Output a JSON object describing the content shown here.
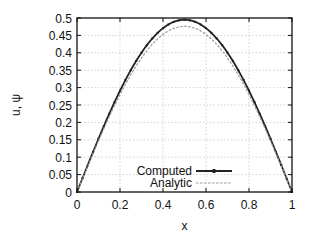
{
  "chart_data": {
    "type": "line",
    "title": "",
    "xlabel": "x",
    "ylabel": "u, ψ",
    "xlim": [
      0,
      1
    ],
    "ylim": [
      0,
      0.5
    ],
    "grid": true,
    "legend_position": "lower center (inside plot)",
    "x_ticks": [
      "0",
      "0.2",
      "0.4",
      "0.6",
      "0.8",
      "1"
    ],
    "y_ticks": [
      "0",
      "0.05",
      "0.1",
      "0.15",
      "0.2",
      "0.25",
      "0.3",
      "0.35",
      "0.4",
      "0.45",
      "0.5"
    ],
    "series": [
      {
        "name": "Computed",
        "style": "solid with point markers",
        "color": "#222222",
        "x": [
          0,
          0.1,
          0.2,
          0.3,
          0.4,
          0.5,
          0.6,
          0.7,
          0.8,
          0.9,
          1
        ],
        "values": [
          0,
          0.178,
          0.317,
          0.416,
          0.475,
          0.495,
          0.475,
          0.416,
          0.317,
          0.178,
          0
        ]
      },
      {
        "name": "Analytic",
        "style": "dashed",
        "color": "#999999",
        "x": [
          0,
          0.1,
          0.2,
          0.3,
          0.4,
          0.5,
          0.6,
          0.7,
          0.8,
          0.9,
          1
        ],
        "values": [
          0,
          0.171,
          0.305,
          0.4,
          0.457,
          0.476,
          0.457,
          0.4,
          0.305,
          0.171,
          0
        ]
      }
    ]
  },
  "layout": {
    "plot_left": 77,
    "plot_top": 18,
    "plot_right": 292,
    "plot_bottom": 192
  }
}
